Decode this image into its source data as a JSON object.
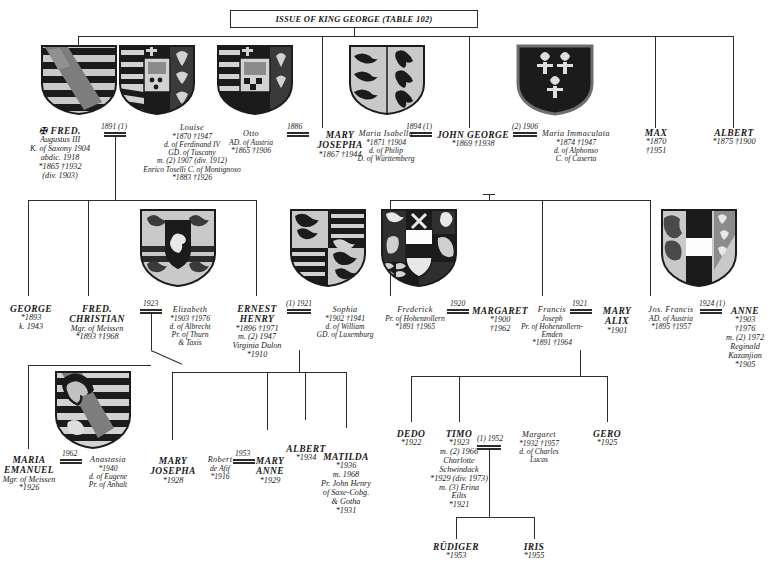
{
  "header": {
    "title": "ISSUE OF KING GEORGE (TABLE 102)"
  },
  "generation1": [
    {
      "id": "fred-augustus",
      "name": "✠ FRED.",
      "lines": [
        "Augustus III",
        "K. of Saxony 1904",
        "abdic. 1918",
        "*1865   †1932",
        "(div. 1903)"
      ]
    },
    {
      "id": "louise",
      "name": "Louise",
      "lines": [
        "*1870   †1947",
        "d. of Ferdinand IV",
        "GD. of Tuscany",
        "m. (2) 1907 (div. 1912)",
        "Enrico Toselli C. of Montignoso",
        "*1883   †1926"
      ]
    },
    {
      "id": "otto",
      "name": "Otto",
      "lines": [
        "AD. of Austria",
        "*1865   †1906"
      ]
    },
    {
      "id": "mary-josepha",
      "name": "MARY",
      "lines": [
        "JOSEPHA",
        "*1867   †1944"
      ]
    },
    {
      "id": "maria-isabella",
      "name": "Maria Isabella",
      "lines": [
        "*1871   †1904",
        "d. of Philip",
        "D. of Württemberg"
      ]
    },
    {
      "id": "john-george",
      "name": "JOHN GEORGE",
      "lines": [
        "*1869   †1938"
      ]
    },
    {
      "id": "maria-immaculata",
      "name": "Maria Immaculata",
      "lines": [
        "*1874   †1947",
        "d. of Alphonso",
        "C. of Caserta"
      ]
    },
    {
      "id": "max",
      "name": "MAX",
      "lines": [
        "*1870",
        "†1951"
      ]
    },
    {
      "id": "albert-1875",
      "name": "ALBERT",
      "lines": [
        "*1875   †1900"
      ]
    }
  ],
  "marriages1": [
    {
      "id": "m-fred-louise",
      "year": "1891 (1)"
    },
    {
      "id": "m-otto-mary",
      "year": "1886"
    },
    {
      "id": "m-isabella-john",
      "year": "1894 (1)"
    },
    {
      "id": "m-john-immaculata",
      "year": "(2) 1906"
    }
  ],
  "generation2": [
    {
      "id": "george",
      "name": "GEORGE",
      "lines": [
        "*1893",
        "k. 1943"
      ]
    },
    {
      "id": "fred-christian",
      "name": "FRED.",
      "lines": [
        "CHRISTIAN",
        "Mgr. of Meissen",
        "*1893   †1968"
      ]
    },
    {
      "id": "elizabeth",
      "name": "Elizabeth",
      "lines": [
        "*1903   †1976",
        "d. of Albrecht",
        "Pr. of Thurn",
        "& Taxis"
      ]
    },
    {
      "id": "ernest-henry",
      "name": "ERNEST",
      "lines": [
        "HENRY",
        "*1896   †1971",
        "m. (2) 1947",
        "Virginia Dulon",
        "*1910"
      ]
    },
    {
      "id": "sophia",
      "name": "Sophia",
      "lines": [
        "*1902   †1941",
        "d. of William",
        "GD. of Luxemburg"
      ]
    },
    {
      "id": "frederick",
      "name": "Frederick",
      "lines": [
        "Pr. of Hohenzollern",
        "*1891   †1965"
      ]
    },
    {
      "id": "margaret",
      "name": "MARGARET",
      "lines": [
        "*1900",
        "†1962"
      ]
    },
    {
      "id": "francis-joseph",
      "name": "Francis",
      "lines": [
        "Joseph",
        "Pr. of Hohenzollern-",
        "Emden",
        "*1891   †1964"
      ]
    },
    {
      "id": "mary-alix",
      "name": "MARY",
      "lines": [
        "ALIX",
        "*1901"
      ]
    },
    {
      "id": "jos-francis",
      "name": "Jos. Francis",
      "lines": [
        "AD. of Austria",
        "*1895   †1957"
      ]
    },
    {
      "id": "anne",
      "name": "ANNE",
      "lines": [
        "*1903",
        "†1976",
        "m. (2) 1972",
        "Reginald",
        "Kazanjian",
        "*1905"
      ]
    }
  ],
  "marriages2": [
    {
      "id": "m-fredchr-eliz",
      "year": "1923"
    },
    {
      "id": "m-ernest-sophia",
      "year": "(1) 1921"
    },
    {
      "id": "m-frederick-margaret",
      "year": "1920"
    },
    {
      "id": "m-francis-maryalix",
      "year": "1921"
    },
    {
      "id": "m-josfrancis-anne",
      "year": "1924 (1)"
    }
  ],
  "generation3": [
    {
      "id": "maria-emanuel",
      "name": "MARIA",
      "lines": [
        "EMANUEL",
        "Mgr. of Meissen",
        "*1926"
      ]
    },
    {
      "id": "anastasia",
      "name": "Anastasia",
      "lines": [
        "*1940",
        "d. of Eugene",
        "Pr. of Anhalt"
      ]
    },
    {
      "id": "mary-josepha-1928",
      "name": "MARY",
      "lines": [
        "JOSEPHA",
        "*1928"
      ]
    },
    {
      "id": "robert-de-afif",
      "name": "Robert",
      "lines": [
        "de Afif",
        "*1916"
      ]
    },
    {
      "id": "mary-anne",
      "name": "MARY",
      "lines": [
        "ANNE",
        "*1929"
      ]
    },
    {
      "id": "albert-1934",
      "name": "ALBERT",
      "lines": [
        "*1934"
      ]
    },
    {
      "id": "matilda",
      "name": "MATILDA",
      "lines": [
        "*1936",
        "m. 1968",
        "Pr. John Henry",
        "of Saxe-Cobg.",
        "& Gotha",
        "*1931"
      ]
    },
    {
      "id": "dedo",
      "name": "DEDO",
      "lines": [
        "*1922"
      ]
    },
    {
      "id": "timo",
      "name": "TIMO",
      "lines": [
        "*1923",
        "m. (2) 1966",
        "Charlotte",
        "Schwindack",
        "*1929 (div. 1973)",
        "m. (3) Erina",
        "Eilts",
        "*1921"
      ]
    },
    {
      "id": "margaret-lucas",
      "name": "Margaret",
      "lines": [
        "*1932   †1957",
        "d. of Charles",
        "Lucas"
      ]
    },
    {
      "id": "gero",
      "name": "GERO",
      "lines": [
        "*1925"
      ]
    }
  ],
  "marriages3": [
    {
      "id": "m-mariaem-anastasia",
      "year": "1962"
    },
    {
      "id": "m-robert-maryanne",
      "year": "1953"
    },
    {
      "id": "m-timo-margaret",
      "year": "(1) 1952"
    }
  ],
  "generation4": [
    {
      "id": "rudiger",
      "name": "RÜDIGER",
      "lines": [
        "*1953"
      ]
    },
    {
      "id": "iris",
      "name": "IRIS",
      "lines": [
        "*1955"
      ]
    }
  ],
  "shields": [
    {
      "id": "shield-saxony",
      "label": "saxony-arms"
    },
    {
      "id": "shield-tuscany",
      "label": "tuscany-arms"
    },
    {
      "id": "shield-austria-tuscany",
      "label": "austria-tuscany-arms"
    },
    {
      "id": "shield-wurttemberg",
      "label": "wurttemberg-arms"
    },
    {
      "id": "shield-bourbon-sicily",
      "label": "bourbon-two-sicilies-arms"
    },
    {
      "id": "shield-meissen",
      "label": "meissen-arms"
    },
    {
      "id": "shield-luxemburg",
      "label": "luxemburg-arms"
    },
    {
      "id": "shield-hohenzollern",
      "label": "hohenzollern-arms"
    },
    {
      "id": "shield-austria",
      "label": "austria-arms"
    },
    {
      "id": "shield-anhalt",
      "label": "anhalt-arms"
    }
  ],
  "colors": {
    "ink": "#2b2b2b",
    "shield_dark": "#1b1b1b",
    "shield_light": "#c9c9c9",
    "shield_mid": "#8c8c8c",
    "paper": "#ffffff"
  }
}
